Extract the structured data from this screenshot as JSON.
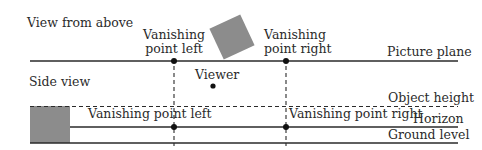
{
  "diagram": {
    "top_view": {
      "title": "View from above",
      "picture_plane_label": "Picture plane",
      "vp_left_label_line1": "Vanishing",
      "vp_left_label_line2": "point left",
      "vp_right_label_line1": "Vanishing",
      "vp_right_label_line2": "point right",
      "viewer_label": "Viewer"
    },
    "side_view": {
      "title": "Side view",
      "object_height_label": "Object height",
      "horizon_label": "Horizon",
      "ground_level_label": "Ground level",
      "vp_left_label": "Vanishing point left",
      "vp_right_label": "Vanishing point right"
    },
    "colors": {
      "line": "#2a2a2a",
      "object_fill": "#8c8c8c",
      "background": "#ffffff"
    }
  }
}
